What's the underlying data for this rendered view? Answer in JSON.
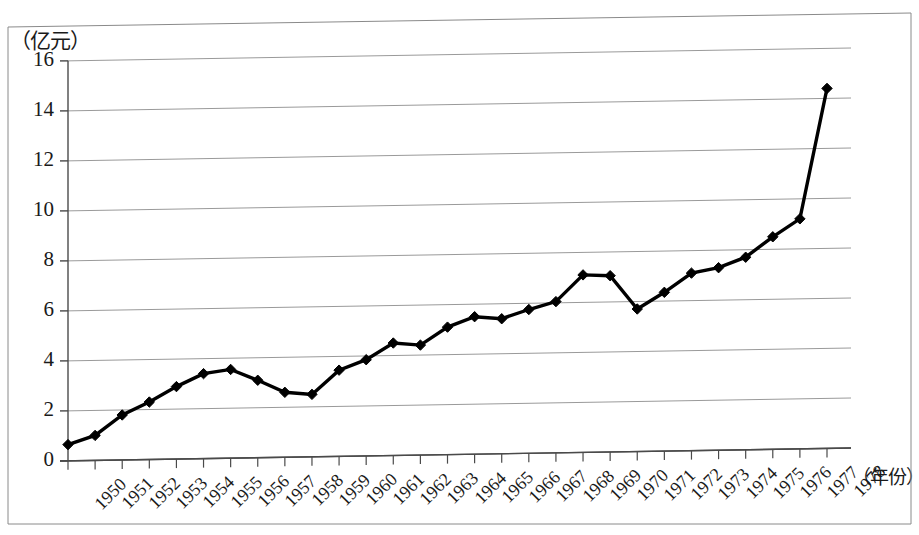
{
  "chart_data": {
    "type": "line",
    "title": "",
    "subtitle": "",
    "xlabel": "（年份）",
    "ylabel": "（亿元）",
    "x": [
      1950,
      1951,
      1952,
      1953,
      1954,
      1955,
      1956,
      1957,
      1958,
      1959,
      1960,
      1961,
      1962,
      1963,
      1964,
      1965,
      1966,
      1967,
      1968,
      1969,
      1970,
      1971,
      1972,
      1973,
      1974,
      1975,
      1976,
      1977,
      1978
    ],
    "categories": [
      "1950",
      "1951",
      "1952",
      "1953",
      "1954",
      "1955",
      "1956",
      "1957",
      "1958",
      "1959",
      "1960",
      "1961",
      "1962",
      "1963",
      "1964",
      "1965",
      "1966",
      "1967",
      "1968",
      "1969",
      "1970",
      "1971",
      "1972",
      "1973",
      "1974",
      "1975",
      "1976",
      "1977",
      "1978"
    ],
    "values": [
      0.65,
      1.0,
      1.8,
      2.3,
      2.9,
      3.4,
      3.55,
      3.1,
      2.6,
      2.5,
      3.45,
      3.85,
      4.5,
      4.4,
      5.1,
      5.5,
      5.4,
      5.75,
      6.05,
      7.1,
      7.05,
      5.7,
      6.35,
      7.1,
      7.3,
      7.7,
      8.5,
      9.2,
      14.4
    ],
    "series": [
      {
        "name": "",
        "values": [
          0.65,
          1.0,
          1.8,
          2.3,
          2.9,
          3.4,
          3.55,
          3.1,
          2.6,
          2.5,
          3.45,
          3.85,
          4.5,
          4.4,
          5.1,
          5.5,
          5.4,
          5.75,
          6.05,
          7.1,
          7.05,
          5.7,
          6.35,
          7.1,
          7.3,
          7.7,
          8.5,
          9.2,
          14.4
        ]
      }
    ],
    "ylim": [
      0,
      16
    ],
    "yticks": [
      0,
      2,
      4,
      6,
      8,
      10,
      12,
      14,
      16
    ],
    "ytick_labels": [
      "0",
      "2",
      "4",
      "6",
      "8",
      "10",
      "12",
      "14",
      "16"
    ],
    "grid": true,
    "grid_axis": "y",
    "legend": false,
    "legend_position": "none",
    "marker": "diamond",
    "line_color": "#000000",
    "grid_color": "#9a9a9a",
    "annotations": []
  }
}
